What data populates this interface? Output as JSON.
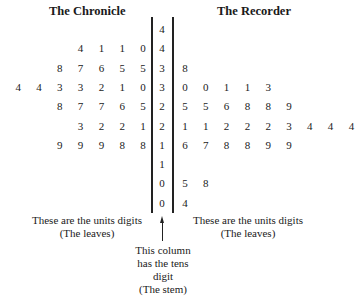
{
  "titles": {
    "left": "The Chronicle",
    "right": "The Recorder"
  },
  "rows": [
    {
      "stem": "4",
      "left": [],
      "right": []
    },
    {
      "stem": "4",
      "left": [
        "4",
        "1",
        "1",
        "0"
      ],
      "right": []
    },
    {
      "stem": "3",
      "left": [
        "8",
        "7",
        "6",
        "5",
        "5"
      ],
      "right": [
        "8"
      ]
    },
    {
      "stem": "3",
      "left": [
        "4",
        "4",
        "3",
        "3",
        "2",
        "1",
        "0"
      ],
      "right": [
        "0",
        "0",
        "1",
        "1",
        "3"
      ]
    },
    {
      "stem": "2",
      "left": [
        "8",
        "7",
        "7",
        "6",
        "5"
      ],
      "right": [
        "5",
        "5",
        "6",
        "8",
        "8",
        "9"
      ]
    },
    {
      "stem": "2",
      "left": [
        "3",
        "2",
        "2",
        "1"
      ],
      "right": [
        "1",
        "1",
        "2",
        "2",
        "2",
        "3",
        "4",
        "4",
        "4"
      ]
    },
    {
      "stem": "1",
      "left": [
        "9",
        "9",
        "9",
        "8",
        "8"
      ],
      "right": [
        "6",
        "7",
        "8",
        "8",
        "9",
        "9"
      ]
    },
    {
      "stem": "1",
      "left": [],
      "right": []
    },
    {
      "stem": "0",
      "left": [],
      "right": [
        "5",
        "8"
      ]
    },
    {
      "stem": "0",
      "left": [],
      "right": [
        "4"
      ]
    }
  ],
  "notes": {
    "left_leaves": [
      "These are the units digits",
      "(The leaves)"
    ],
    "right_leaves": [
      "These are the units digits",
      "(The leaves)"
    ],
    "stem": [
      "This column",
      "has the tens",
      "digit",
      "(The stem)"
    ]
  },
  "chart_data": {
    "type": "table",
    "left_label": "The Chronicle",
    "right_label": "The Recorder",
    "stems": [
      "4",
      "4",
      "3",
      "3",
      "2",
      "2",
      "1",
      "1",
      "0",
      "0"
    ],
    "left_leaves": [
      [],
      [
        "4",
        "1",
        "1",
        "0"
      ],
      [
        "8",
        "7",
        "6",
        "5",
        "5"
      ],
      [
        "4",
        "4",
        "3",
        "3",
        "2",
        "1",
        "0"
      ],
      [
        "8",
        "7",
        "7",
        "6",
        "5"
      ],
      [
        "3",
        "2",
        "2",
        "1"
      ],
      [
        "9",
        "9",
        "9",
        "8",
        "8"
      ],
      [],
      [],
      []
    ],
    "right_leaves": [
      [],
      [],
      [
        "8"
      ],
      [
        "0",
        "0",
        "1",
        "1",
        "3"
      ],
      [
        "5",
        "5",
        "6",
        "8",
        "8",
        "9"
      ],
      [
        "1",
        "1",
        "2",
        "2",
        "2",
        "3",
        "4",
        "4",
        "4"
      ],
      [
        "6",
        "7",
        "8",
        "8",
        "9",
        "9"
      ],
      [],
      [
        "5",
        "8"
      ],
      [
        "4"
      ]
    ]
  }
}
